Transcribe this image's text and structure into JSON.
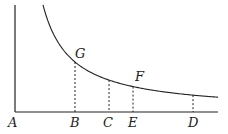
{
  "diagram": {
    "type": "hyperbola-area-diagram",
    "axes": {
      "origin_label": "A",
      "x_axis": {
        "x1": 15,
        "x2": 218,
        "y": 112
      },
      "y_axis": {
        "x": 15,
        "y1": 5,
        "y2": 112
      }
    },
    "curve": {
      "description": "rectangular hyperbola asymptotic to both axes",
      "k": 3000,
      "x_start": 43,
      "x_end": 218
    },
    "ordinates": [
      {
        "foot": "B",
        "x": 75,
        "point": "G"
      },
      {
        "foot": "C",
        "x": 109,
        "point": ""
      },
      {
        "foot": "E",
        "x": 133,
        "point": "F"
      },
      {
        "foot": "D",
        "x": 193,
        "point": ""
      }
    ],
    "labels": {
      "A": "A",
      "B": "B",
      "C": "C",
      "E": "E",
      "D": "D",
      "G": "G",
      "F": "F"
    }
  }
}
